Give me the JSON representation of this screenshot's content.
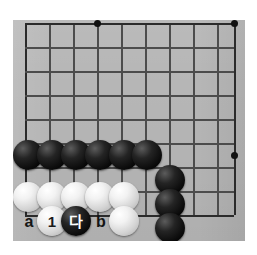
{
  "diagram": {
    "type": "go-board-diagram",
    "board_color": "#b6b6b6",
    "line_color": "#2b2b2b",
    "black_stone_color": "#0a0a0a",
    "white_stone_color": "#f2f2f2",
    "board_rect": {
      "left": 13,
      "top": 20,
      "width": 232,
      "height": 221
    },
    "grid": {
      "columns_x": [
        25,
        49,
        73,
        97,
        121,
        145,
        169,
        193,
        217,
        234
      ],
      "rows_y": [
        23,
        47,
        71,
        95,
        119,
        143,
        167,
        191,
        215
      ],
      "spacing": 24
    },
    "star_points": [
      {
        "name": "star-point-top-left-area",
        "x": 97,
        "y": 23
      },
      {
        "name": "star-point-top-right-area",
        "x": 234,
        "y": 23
      },
      {
        "name": "star-point-right-side",
        "x": 234,
        "y": 155
      }
    ],
    "stones": [
      {
        "color": "black",
        "x": 28,
        "y": 155,
        "label": ""
      },
      {
        "color": "black",
        "x": 52,
        "y": 155,
        "label": ""
      },
      {
        "color": "black",
        "x": 76,
        "y": 155,
        "label": ""
      },
      {
        "color": "black",
        "x": 100,
        "y": 155,
        "label": ""
      },
      {
        "color": "black",
        "x": 124,
        "y": 155,
        "label": ""
      },
      {
        "color": "black",
        "x": 147,
        "y": 155,
        "label": ""
      },
      {
        "color": "black",
        "x": 170,
        "y": 180,
        "label": ""
      },
      {
        "color": "black",
        "x": 170,
        "y": 204,
        "label": ""
      },
      {
        "color": "black",
        "x": 170,
        "y": 228,
        "label": ""
      },
      {
        "color": "white",
        "x": 28,
        "y": 197,
        "label": ""
      },
      {
        "color": "white",
        "x": 52,
        "y": 197,
        "label": ""
      },
      {
        "color": "white",
        "x": 76,
        "y": 197,
        "label": ""
      },
      {
        "color": "white",
        "x": 100,
        "y": 197,
        "label": ""
      },
      {
        "color": "white",
        "x": 124,
        "y": 197,
        "label": ""
      },
      {
        "color": "white",
        "x": 52,
        "y": 221,
        "label": "1"
      },
      {
        "color": "black",
        "x": 76,
        "y": 221,
        "label": "000"
      },
      {
        "color": "white",
        "x": 124,
        "y": 221,
        "label": ""
      }
    ],
    "point_labels": [
      {
        "name": "point-label-a",
        "text": "a",
        "x": 29,
        "y": 222
      },
      {
        "name": "point-label-b",
        "text": "b",
        "x": 101,
        "y": 222
      }
    ],
    "move_labels": {
      "move_1": "1",
      "move_da": "다"
    }
  }
}
